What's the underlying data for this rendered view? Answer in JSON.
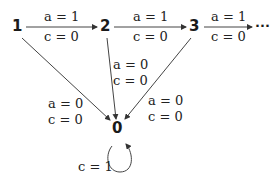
{
  "diagram": {
    "nodes": [
      {
        "id": "1",
        "label": "1"
      },
      {
        "id": "2",
        "label": "2"
      },
      {
        "id": "3",
        "label": "3"
      },
      {
        "id": "0",
        "label": "0"
      }
    ],
    "ellipsis": "···",
    "edges": [
      {
        "from": "1",
        "to": "2",
        "label_a": "a = 1",
        "label_c": "c = 0"
      },
      {
        "from": "2",
        "to": "3",
        "label_a": "a = 1",
        "label_c": "c = 0"
      },
      {
        "from": "3",
        "to": "...",
        "label_a": "a = 1",
        "label_c": "c = 0"
      },
      {
        "from": "1",
        "to": "0",
        "label_a": "a = 0",
        "label_c": "c = 0"
      },
      {
        "from": "2",
        "to": "0",
        "label_a": "a = 0",
        "label_c": "c = 0"
      },
      {
        "from": "3",
        "to": "0",
        "label_a": "a = 0",
        "label_c": "c = 0"
      },
      {
        "from": "0",
        "to": "0",
        "label_c": "c = 1"
      }
    ]
  }
}
